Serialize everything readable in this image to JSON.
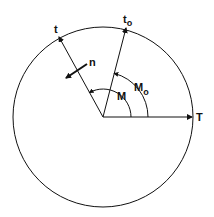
{
  "diagram": {
    "type": "mean-anomaly-circle",
    "labels": {
      "t": "t",
      "t0_main": "t",
      "t0_sub": "o",
      "T": "T",
      "n": "n",
      "M": "M",
      "M0_main": "M",
      "M0_sub": "o"
    },
    "colors": {
      "stroke": "#111111",
      "background": "#ffffff"
    }
  }
}
